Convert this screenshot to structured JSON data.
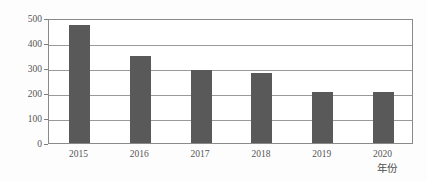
{
  "chart_data": {
    "type": "bar",
    "title": "",
    "xlabel": "年份",
    "ylabel": "供水量/万 m",
    "ylabel_superscript": "3",
    "categories": [
      "2015",
      "2016",
      "2017",
      "2018",
      "2019",
      "2020"
    ],
    "values": [
      473,
      347,
      292,
      279,
      205,
      205
    ],
    "ylim": [
      0,
      500
    ],
    "yticks": [
      "0",
      "100",
      "200",
      "300",
      "400",
      "500"
    ],
    "ytick_values": [
      0,
      100,
      200,
      300,
      400,
      500
    ],
    "grid": true,
    "legend": "none",
    "bar_color": "#595959",
    "grid_color": "#9a9a9a",
    "frame_color": "#8a8a8a",
    "background_color": "#fdfdfd",
    "plot_background_color": "#ffffff",
    "text_color": "#555555"
  }
}
